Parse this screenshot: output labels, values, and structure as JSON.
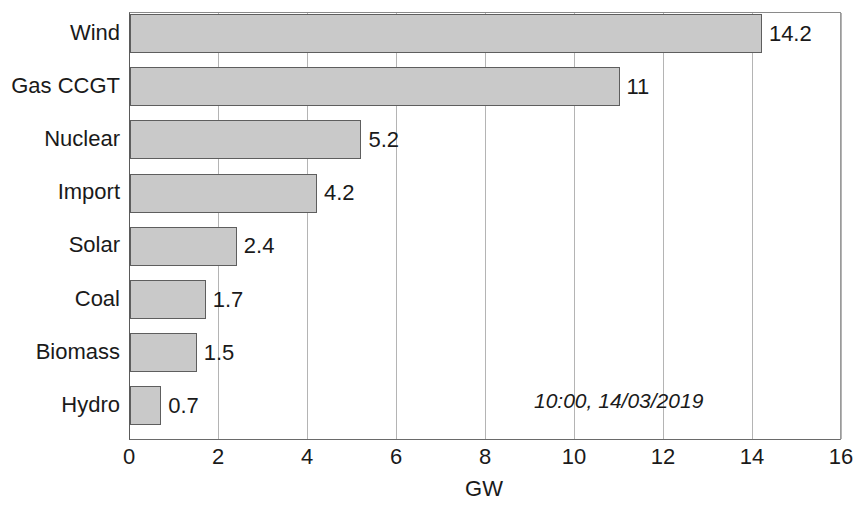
{
  "chart_data": {
    "type": "bar",
    "orientation": "horizontal",
    "title": "",
    "xlabel": "GW",
    "ylabel": "",
    "xlim": [
      0,
      16
    ],
    "grid": true,
    "legend": null,
    "categories": [
      "Wind",
      "Gas CCGT",
      "Nuclear",
      "Import",
      "Solar",
      "Coal",
      "Biomass",
      "Hydro"
    ],
    "values": [
      14.2,
      11,
      5.2,
      4.2,
      2.4,
      1.7,
      1.5,
      0.7
    ],
    "value_labels": [
      "14.2",
      "11",
      "5.2",
      "4.2",
      "2.4",
      "1.7",
      "1.5",
      "0.7"
    ],
    "xticks": [
      0,
      2,
      4,
      6,
      8,
      10,
      12,
      14,
      16
    ],
    "xtick_labels": [
      "0",
      "2",
      "4",
      "6",
      "8",
      "10",
      "12",
      "14",
      "16"
    ],
    "annotations": [
      {
        "text": "10:00, 14/03/2019",
        "style": "italic"
      }
    ],
    "colors": {
      "bar_fill": "#c9c9c9",
      "bar_edge": "#5e5e5e",
      "gridline": "#b4b4b4",
      "axis": "#5a5a5a",
      "text": "#1a1a1a",
      "background": "#ffffff"
    }
  }
}
